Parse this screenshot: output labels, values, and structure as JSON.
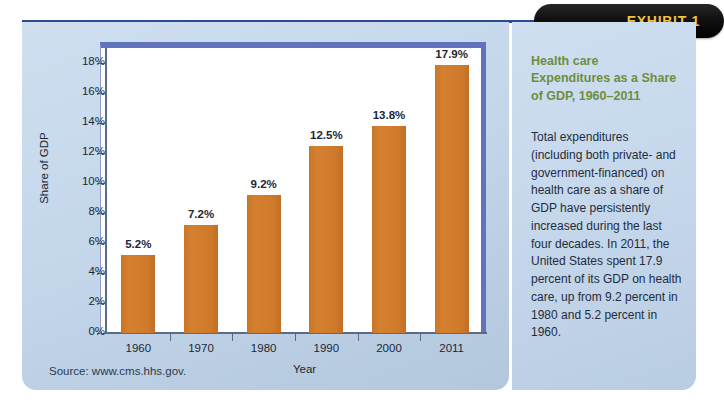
{
  "exhibit": {
    "tab_label": "EXHIBIT 1",
    "title": "Health care Expenditures as a Share of GDP, 1960–2011",
    "body": "Total expenditures (including both private- and government-financed) on health care as a share of GDP have persistently increased during the last four decades. In 2011, the United States spent 17.9 percent of its GDP on health care, up from 9.2 percent in 1980 and 5.2 percent in 1960.",
    "source": "Source: www.cms.hhs.gov."
  },
  "colors": {
    "bar": "#cf7a2b",
    "panel_background": "#c6d8ec",
    "title_green": "#6f8d3e",
    "tab_black": "#000000",
    "tab_text_gold": "#f2c43d",
    "plot_border": "#6073bc",
    "rule_navy": "#2f4a8c"
  },
  "chart_data": {
    "type": "bar",
    "title": "Health care Expenditures as a Share of GDP, 1960–2011",
    "xlabel": "Year",
    "ylabel": "Share of GDP",
    "categories": [
      "1960",
      "1970",
      "1980",
      "1990",
      "2000",
      "2011"
    ],
    "values": [
      5.2,
      7.2,
      9.2,
      12.5,
      13.8,
      17.9
    ],
    "value_labels": [
      "5.2%",
      "7.2%",
      "9.2%",
      "12.5%",
      "13.8%",
      "17.9%"
    ],
    "ylim": [
      0,
      19
    ],
    "ytick_values": [
      0,
      2,
      4,
      6,
      8,
      10,
      12,
      14,
      16,
      18
    ],
    "ytick_labels": [
      "0%",
      "2%",
      "4%",
      "6%",
      "8%",
      "10%",
      "12%",
      "14%",
      "16%",
      "18%"
    ],
    "grid": false,
    "legend": "none",
    "units": "percent of GDP"
  }
}
